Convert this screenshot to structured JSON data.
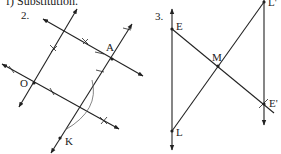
{
  "header": {
    "text": "f)  Substitution."
  },
  "figure2": {
    "number": "2.",
    "points": {
      "A": "A",
      "O": "O",
      "K": "K"
    }
  },
  "figure3": {
    "number": "3.",
    "points": {
      "E": "E",
      "M": "M",
      "L": "L",
      "L_prime": "L'",
      "E_prime": "E'"
    }
  },
  "colors": {
    "ink": "#222222",
    "arc": "#666666",
    "background": "#ffffff"
  }
}
